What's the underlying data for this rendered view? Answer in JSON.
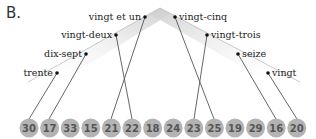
{
  "panel_label": "B.",
  "colors": {
    "circle_fill": "#b3b3b3",
    "circle_text": "#555555",
    "line": "#555555",
    "wedge": "#d6d6d6",
    "dot": "#111111"
  },
  "left_branch": [
    {
      "word": "vingt et un",
      "target": "21"
    },
    {
      "word": "vingt-deux",
      "target": "22"
    },
    {
      "word": "dix-sept",
      "target": "17"
    },
    {
      "word": "trente",
      "target": "30"
    }
  ],
  "right_branch": [
    {
      "word": "vingt-cinq",
      "target": "25"
    },
    {
      "word": "vingt-trois",
      "target": "23"
    },
    {
      "word": "seize",
      "target": "16"
    },
    {
      "word": "vingt",
      "target": "20"
    }
  ],
  "numbers": [
    "30",
    "17",
    "33",
    "15",
    "21",
    "22",
    "18",
    "24",
    "23",
    "25",
    "19",
    "29",
    "16",
    "20"
  ]
}
